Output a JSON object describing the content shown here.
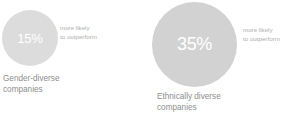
{
  "chart_data": {
    "type": "bar",
    "title": "",
    "xlabel": "",
    "ylabel": "",
    "categories": [
      "Gender-diverse companies",
      "Ethnically diverse companies"
    ],
    "values": [
      15,
      35
    ],
    "value_unit": "%",
    "value_meaning": "more likely to outperform",
    "grid": false,
    "legend_position": "none",
    "encoding": "proportional circles (bubble)",
    "colors": {
      "bubble_gender": "#dcdcdc",
      "bubble_ethnic": "#d2d2d2",
      "value_text": "#ffffff",
      "caption_text": "#adadad",
      "label_text": "#8e8e8e",
      "background": "#ffffff"
    }
  },
  "groups": [
    {
      "value": "15%",
      "caption_line_1": "more likely",
      "caption_line_2": "to outperform",
      "label_line_1": "Gender-diverse",
      "label_line_2": "companies"
    },
    {
      "value": "35%",
      "caption_line_1": "more likely",
      "caption_line_2": "to outperform",
      "label_line_1": "Ethnically diverse",
      "label_line_2": "companies"
    }
  ]
}
